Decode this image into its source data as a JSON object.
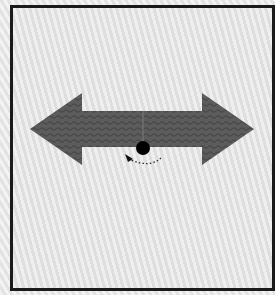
{
  "figure": {
    "colors": {
      "frame_border": "#1a1a1a",
      "background": "#e6e6e6",
      "arrow_fill": "#5c5c5c",
      "pivot_dot": "#000000",
      "rotation_arc": "#222222"
    },
    "elements": {
      "arrow": {
        "type": "double-headed-arrow",
        "orientation": "horizontal",
        "left_tip": [
          30,
          129
        ],
        "right_tip": [
          254,
          129
        ],
        "shaft_top": 111,
        "shaft_bottom": 147,
        "head_left_base_x": 82,
        "head_right_base_x": 202,
        "head_top": 93,
        "head_bottom": 165
      },
      "pivot": {
        "type": "dot",
        "center": [
          143,
          148
        ],
        "radius": 7
      },
      "rotation_indicator": {
        "type": "dotted-arc-arrow",
        "direction": "clockwise-to-left",
        "start": [
          161,
          158
        ],
        "end": [
          127,
          157
        ]
      }
    }
  }
}
